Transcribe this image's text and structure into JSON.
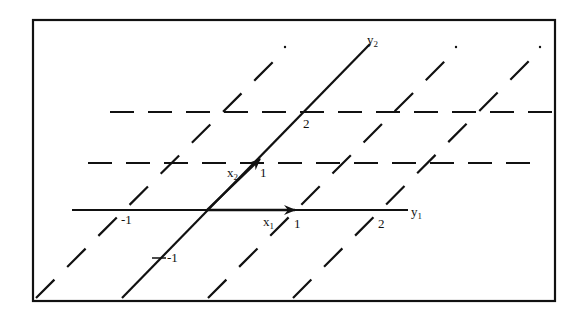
{
  "diagram": {
    "type": "oblique coordinate grid / basis change",
    "frame": {
      "x": 33,
      "y": 20,
      "width": 522,
      "height": 281,
      "stroke": "#111111"
    },
    "colors": {
      "ink": "#111111",
      "background": "#ffffff"
    },
    "axes": {
      "y1": {
        "label_main": "y",
        "label_sub": "1",
        "from": [
          72,
          210
        ],
        "to": [
          408,
          210
        ]
      },
      "y2": {
        "label_main": "y",
        "label_sub": "2",
        "from": [
          122,
          298
        ],
        "to": [
          370,
          44
        ]
      }
    },
    "basis_vectors": {
      "x1": {
        "label_main": "x",
        "label_sub": "1",
        "from": [
          207,
          210
        ],
        "to": [
          294,
          210
        ]
      },
      "x2": {
        "label_main": "x",
        "label_sub": "2",
        "from": [
          207,
          210
        ],
        "to": [
          259,
          160
        ]
      }
    },
    "tick_labels": {
      "y1_minus1": "-1",
      "y1_1": "1",
      "y1_2": "2",
      "y2_1": "1",
      "y2_2": "2",
      "y2_minus1": "-1"
    },
    "dashed_horizontals": [
      {
        "y": 163,
        "x1": 88,
        "x2": 530
      },
      {
        "y": 112,
        "x1": 110,
        "x2": 553
      }
    ],
    "dashed_diagonals": [
      {
        "name": "through y1=-1",
        "from": [
          36,
          298
        ],
        "to": [
          285,
          48
        ]
      },
      {
        "name": "through y1=1",
        "from": [
          208,
          298
        ],
        "to": [
          456,
          48
        ]
      },
      {
        "name": "through y1=2",
        "from": [
          293,
          298
        ],
        "to": [
          540,
          48
        ]
      }
    ]
  }
}
